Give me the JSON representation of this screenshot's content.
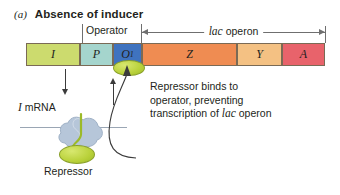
{
  "figure": {
    "panel_letter": "(a)",
    "title": "Absence of inducer"
  },
  "labels": {
    "operator": "Operator",
    "operon_italic": "lac",
    "operon_rest": "operon",
    "mrna_italic": "I",
    "mrna_rest": "mRNA",
    "repressor": "Repressor"
  },
  "note": {
    "line1": "Repressor binds to",
    "line2": "operator, preventing",
    "line3_pre": "transcription of ",
    "line3_italic": "lac",
    "line3_post": " operon"
  },
  "genes": [
    {
      "name": "I",
      "subscript": "",
      "color": "#ccdb6e",
      "left": 0,
      "width": 54
    },
    {
      "name": "P",
      "subscript": "",
      "color": "#a5d5cd",
      "left": 54,
      "width": 33
    },
    {
      "name": "O",
      "subscript": "1",
      "color": "#3f73bf",
      "left": 87,
      "width": 29
    },
    {
      "name": "Z",
      "subscript": "",
      "color": "#ef8c52",
      "left": 116,
      "width": 95
    },
    {
      "name": "Y",
      "subscript": "",
      "color": "#f4c183",
      "left": 211,
      "width": 45
    },
    {
      "name": "A",
      "subscript": "",
      "color": "#e8636b",
      "left": 256,
      "width": 43
    }
  ],
  "colors": {
    "repressor_green": "#b9d13a",
    "ribosome_blue": "#b6c6d9",
    "polypeptide_green": "#9cba28",
    "outline": "#7a6a55",
    "rule": "#6f6f6f",
    "arrow": "#3b3b3b",
    "text": "#231f20",
    "background": "#ffffff"
  },
  "icons": {
    "operon_left_arrow": "arrow-left-icon",
    "operon_right_arrow": "arrow-right-icon",
    "transcription_arrow": "arrow-down-icon",
    "binding_arrow": "arrow-up-icon",
    "repressor_path_arrow": "curved-arrow-icon"
  }
}
